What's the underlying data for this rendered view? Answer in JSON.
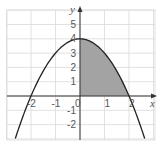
{
  "chart_data": {
    "type": "area",
    "title": "",
    "function": "y = 4 - x^2",
    "xlabel": "x",
    "ylabel": "y",
    "xlim": [
      -3,
      3
    ],
    "ylim": [
      -3,
      6
    ],
    "grid": true,
    "x_ticks": [
      -2,
      -1,
      0,
      1,
      2
    ],
    "y_ticks": [
      -2,
      -1,
      1,
      2,
      3,
      4,
      5
    ],
    "x_tick_labels": [
      "-2",
      "-1",
      "0",
      "1",
      "2"
    ],
    "y_tick_labels": [
      "-2",
      "-1",
      "1",
      "2",
      "3",
      "4",
      "5"
    ],
    "series": [
      {
        "name": "parabola",
        "x": [
          -3,
          -2,
          -1,
          0,
          1,
          2,
          3
        ],
        "y": [
          -5,
          0,
          3,
          4,
          3,
          0,
          -5
        ]
      }
    ],
    "shaded_region": {
      "description": "area under curve between x=0 and x=2, above x-axis",
      "x_from": 0,
      "x_to": 2
    },
    "colors": {
      "grid": "#d9d9d9",
      "curve": "#222222",
      "shade": "#a3a3a3",
      "axis": "#333333"
    }
  }
}
